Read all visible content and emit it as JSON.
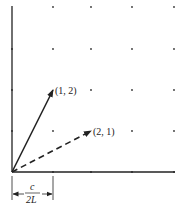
{
  "diagram": {
    "type": "vector-lattice",
    "axes": {
      "x_axis": "horizontal",
      "y_axis": "vertical"
    },
    "lattice": {
      "columns": 5,
      "rows": 5
    },
    "vectors": [
      {
        "label": "(1, 2)",
        "components": [
          1,
          2
        ],
        "style": "solid"
      },
      {
        "label": "(2, 1)",
        "components": [
          2,
          1
        ],
        "style": "dashed"
      }
    ],
    "spacing_label": {
      "numerator": "c",
      "denominator": "2L"
    },
    "colors": {
      "ink": "#222222",
      "background": "#ffffff"
    }
  }
}
